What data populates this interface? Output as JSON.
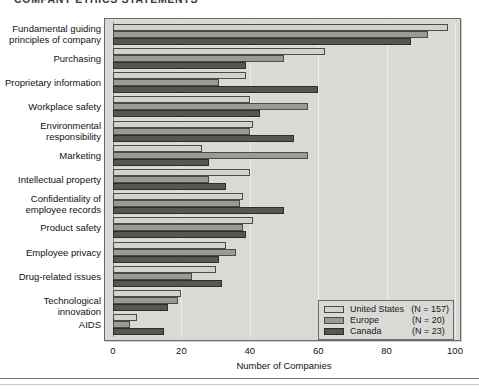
{
  "figure": {
    "title": "COMPANY ETHICS STATEMENTS"
  },
  "legend": {
    "entries": [
      {
        "label": "United States",
        "n": "(N = 157)",
        "color": "#d2d2ce",
        "key": "us"
      },
      {
        "label": "Europe",
        "n": "(N = 20)",
        "color": "#9a9a96",
        "key": "europe"
      },
      {
        "label": "Canada",
        "n": "(N = 23)",
        "color": "#565653",
        "key": "canada"
      }
    ]
  },
  "chart_data": {
    "type": "bar",
    "orientation": "horizontal",
    "title": "COMPANY ETHICS STATEMENTS",
    "xlabel": "Number of Companies",
    "ylabel": "",
    "xlim": [
      0,
      100
    ],
    "xticks": [
      0,
      20,
      40,
      60,
      80,
      100
    ],
    "grid": true,
    "legend_position": "bottom-right",
    "categories": [
      "Fundamental guiding principles of company",
      "Purchasing",
      "Proprietary information",
      "Workplace safety",
      "Environmental responsibility",
      "Marketing",
      "Intellectual property",
      "Confidentiality of employee records",
      "Product safety",
      "Employee privacy",
      "Drug-related issues",
      "Technological innovation",
      "AIDS"
    ],
    "series": [
      {
        "name": "United States",
        "n": 157,
        "color": "#d2d2ce",
        "values": [
          98,
          62,
          39,
          40,
          41,
          26,
          40,
          38,
          41,
          33,
          30,
          20,
          7
        ]
      },
      {
        "name": "Europe",
        "n": 20,
        "color": "#9a9a96",
        "values": [
          92,
          50,
          31,
          57,
          40,
          57,
          28,
          37,
          38,
          36,
          23,
          19,
          5
        ]
      },
      {
        "name": "Canada",
        "n": 23,
        "color": "#565653",
        "values": [
          87,
          39,
          60,
          43,
          53,
          28,
          33,
          50,
          39,
          31,
          32,
          16,
          15
        ]
      }
    ]
  }
}
